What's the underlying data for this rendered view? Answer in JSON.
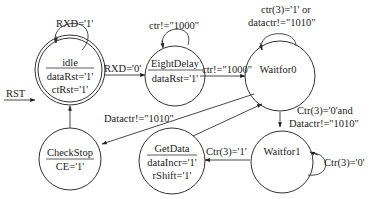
{
  "states": [
    {
      "id": "idle",
      "name": "idle",
      "outputs": [
        "dataRst='1'",
        "ctRst='1'"
      ],
      "initial": true
    },
    {
      "id": "eightdelay",
      "name": "EightDelay",
      "outputs": [
        "dataRst='1'"
      ],
      "initial": false
    },
    {
      "id": "waitfor0",
      "name": "Waitfor0",
      "outputs": [],
      "initial": false
    },
    {
      "id": "waitfor1",
      "name": "Waitfor1",
      "outputs": [],
      "initial": false
    },
    {
      "id": "getdata",
      "name": "GetData",
      "outputs": [
        "dataIncr='1'",
        "rShift='1'"
      ],
      "initial": false
    },
    {
      "id": "checkstop",
      "name": "CheckStop",
      "outputs": [
        "CE='1'"
      ],
      "initial": false
    }
  ],
  "reset": {
    "label": "RST",
    "to": "idle"
  },
  "transitions": [
    {
      "from": "idle",
      "to": "idle",
      "label": "RXD='1'"
    },
    {
      "from": "idle",
      "to": "eightdelay",
      "label": "RXD='0'"
    },
    {
      "from": "eightdelay",
      "to": "eightdelay",
      "label": "ctr!=\"1000\""
    },
    {
      "from": "eightdelay",
      "to": "waitfor0",
      "label": "ctr!=\"1000\""
    },
    {
      "from": "waitfor0",
      "to": "waitfor0",
      "label_lines": [
        "ctr(3)='1' or",
        "datactr!=\"1010\""
      ]
    },
    {
      "from": "waitfor0",
      "to": "waitfor1",
      "label_lines": [
        "Ctr(3)='0'and",
        "Datactr!=\"1010\""
      ]
    },
    {
      "from": "waitfor0",
      "to": "checkstop",
      "label": "Datactr!=\"1010\""
    },
    {
      "from": "waitfor1",
      "to": "waitfor1",
      "label": "Ctr(3)='0'"
    },
    {
      "from": "waitfor1",
      "to": "getdata",
      "label": "Ctr(3)='1'"
    },
    {
      "from": "getdata",
      "to": "waitfor0",
      "label": ""
    },
    {
      "from": "checkstop",
      "to": "idle",
      "label": ""
    }
  ]
}
